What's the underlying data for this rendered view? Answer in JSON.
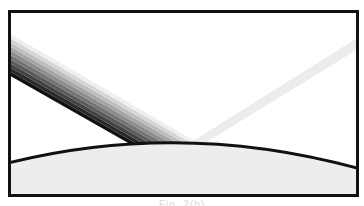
{
  "diagram": {
    "frame": {
      "x": 9,
      "y": 11,
      "width": 349,
      "height": 185,
      "stroke": "#111111"
    },
    "incident_beam": {
      "description": "Wide beam graded from black (lower edge) to light gray (upper edge), entering from the left",
      "stripes": 10,
      "color_dark": "#111111",
      "color_light": "#efefef"
    },
    "reflected_beam": {
      "description": "Faint reflected beam leaving toward the upper right",
      "color": "#ebebeb"
    },
    "surface": {
      "description": "Convex curved surface with light gray fill",
      "fill": "#ededed",
      "stroke": "#111111",
      "left_y": 163,
      "apex_y": 141,
      "right_y": 168
    }
  },
  "caption": {
    "text": "Fig. 2(b)"
  }
}
